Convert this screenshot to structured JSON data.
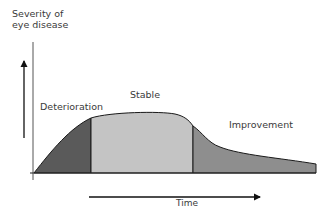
{
  "diagram": {
    "y_axis_label_line1": "Severity of",
    "y_axis_label_line2": "eye disease",
    "x_axis_label": "Time",
    "phases": [
      {
        "label": "Deterioration",
        "color": "#5a5a5a"
      },
      {
        "label": "Stable",
        "color": "#c4c4c4"
      },
      {
        "label": "Improvement",
        "color": "#8e8e8e"
      }
    ],
    "outline_color": "#1a1a1a"
  }
}
